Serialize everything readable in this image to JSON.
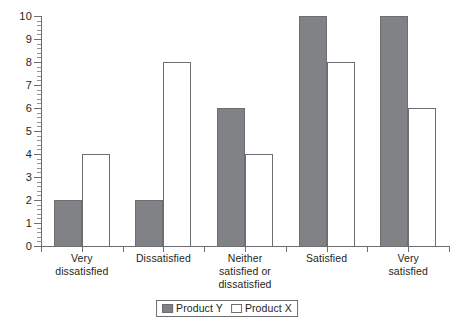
{
  "chart_data": {
    "type": "bar",
    "title": "",
    "subtitle": "",
    "xlabel": "",
    "ylabel": "",
    "ylim": [
      0,
      10
    ],
    "ytick_step": 1,
    "yminor_step": 0.2,
    "grid": false,
    "legend_position": "bottom",
    "categories": [
      "Very\ndissatisfied",
      "Dissatisfied",
      "Neither\nsatisfied or\ndissatisfied",
      "Satisfied",
      "Very\nsatisfied"
    ],
    "category_lines": [
      [
        "Very",
        "dissatisfied"
      ],
      [
        "Dissatisfied"
      ],
      [
        "Neither",
        "satisfied or",
        "dissatisfied"
      ],
      [
        "Satisfied"
      ],
      [
        "Very",
        "satisfied"
      ]
    ],
    "series": [
      {
        "name": "Product Y",
        "color": "#808285",
        "values": [
          2,
          2,
          6,
          10,
          10
        ]
      },
      {
        "name": "Product X",
        "color": "#ffffff",
        "values": [
          4,
          8,
          4,
          8,
          6
        ]
      }
    ],
    "ytick_labels": [
      "0",
      "1",
      "2",
      "3",
      "4",
      "5",
      "6",
      "7",
      "8",
      "9",
      "10"
    ]
  },
  "legend": {
    "items": [
      {
        "label": "Product Y",
        "swatch": "filled-gray-swatch"
      },
      {
        "label": "Product X",
        "swatch": "empty-white-swatch"
      }
    ]
  },
  "colors": {
    "series_y_fill": "#808285",
    "series_x_fill": "#ffffff",
    "axis": "#6d6e71",
    "text": "#231f20",
    "background": "#ffffff"
  }
}
